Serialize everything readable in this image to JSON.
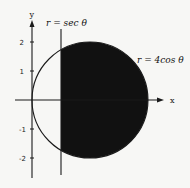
{
  "diagram": {
    "curves": [
      {
        "label": "r = sec θ",
        "type": "vertical-line",
        "x": 1
      },
      {
        "label": "r = 4cos θ",
        "type": "circle",
        "center": [
          2,
          0
        ],
        "radius": 2
      }
    ],
    "shaded_region": "inside r = 4cos θ and to the right of r = sec θ",
    "axes": {
      "x_label": "x",
      "y_label": "y",
      "y_ticks": [
        "2",
        "1",
        "-1",
        "-2"
      ]
    },
    "colors": {
      "fill": "#111111",
      "line": "#1a1a1a",
      "background": "#f7f7f5"
    }
  }
}
